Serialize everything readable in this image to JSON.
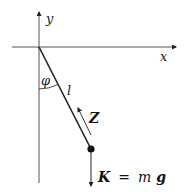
{
  "diagram": {
    "axes": {
      "x_label": "x",
      "y_label": "y"
    },
    "angle_label": "φ",
    "length_label": "l",
    "tension_label": "Z",
    "force_label": {
      "lhs": "K",
      "eq": "=",
      "m": "m",
      "g": "g"
    },
    "colors": {
      "line": "#222222",
      "axis": "#555555",
      "background": "#ffffff"
    }
  }
}
